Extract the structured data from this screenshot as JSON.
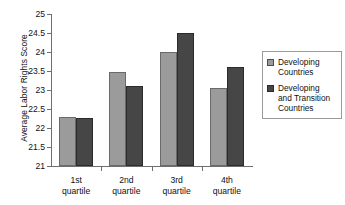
{
  "chart_data": {
    "type": "bar",
    "title": "",
    "xlabel": "",
    "ylabel": "Average Labor Rights Score",
    "ylim": [
      21,
      25
    ],
    "ytick_step": 0.5,
    "grid": false,
    "legend_position": "right",
    "categories": [
      "1st quartile",
      "2nd quartile",
      "3rd quartile",
      "4th quartile"
    ],
    "ytick_labels": [
      "21",
      "21.5",
      "22",
      "22.5",
      "23",
      "23.5",
      "24",
      "24.5",
      "25"
    ],
    "ytick_values": [
      21,
      21.5,
      22,
      22.5,
      23,
      23.5,
      24,
      24.5,
      25
    ],
    "series": [
      {
        "name": "Developing Countries",
        "color": "#9b9b9b",
        "values": [
          22.29,
          23.47,
          24.0,
          23.05
        ]
      },
      {
        "name": "Developing and Transition Countries",
        "color": "#464646",
        "values": [
          22.26,
          23.1,
          24.5,
          23.6
        ]
      }
    ]
  },
  "legend": {
    "entries": [
      {
        "label_line1": "Developing",
        "label_line2": "Countries",
        "label_line3": "",
        "swatch": "light"
      },
      {
        "label_line1": "Developing",
        "label_line2": "and Transition",
        "label_line3": "Countries",
        "swatch": "dark"
      }
    ]
  },
  "axes": {
    "y_title": "Average Labor Rights Score"
  }
}
